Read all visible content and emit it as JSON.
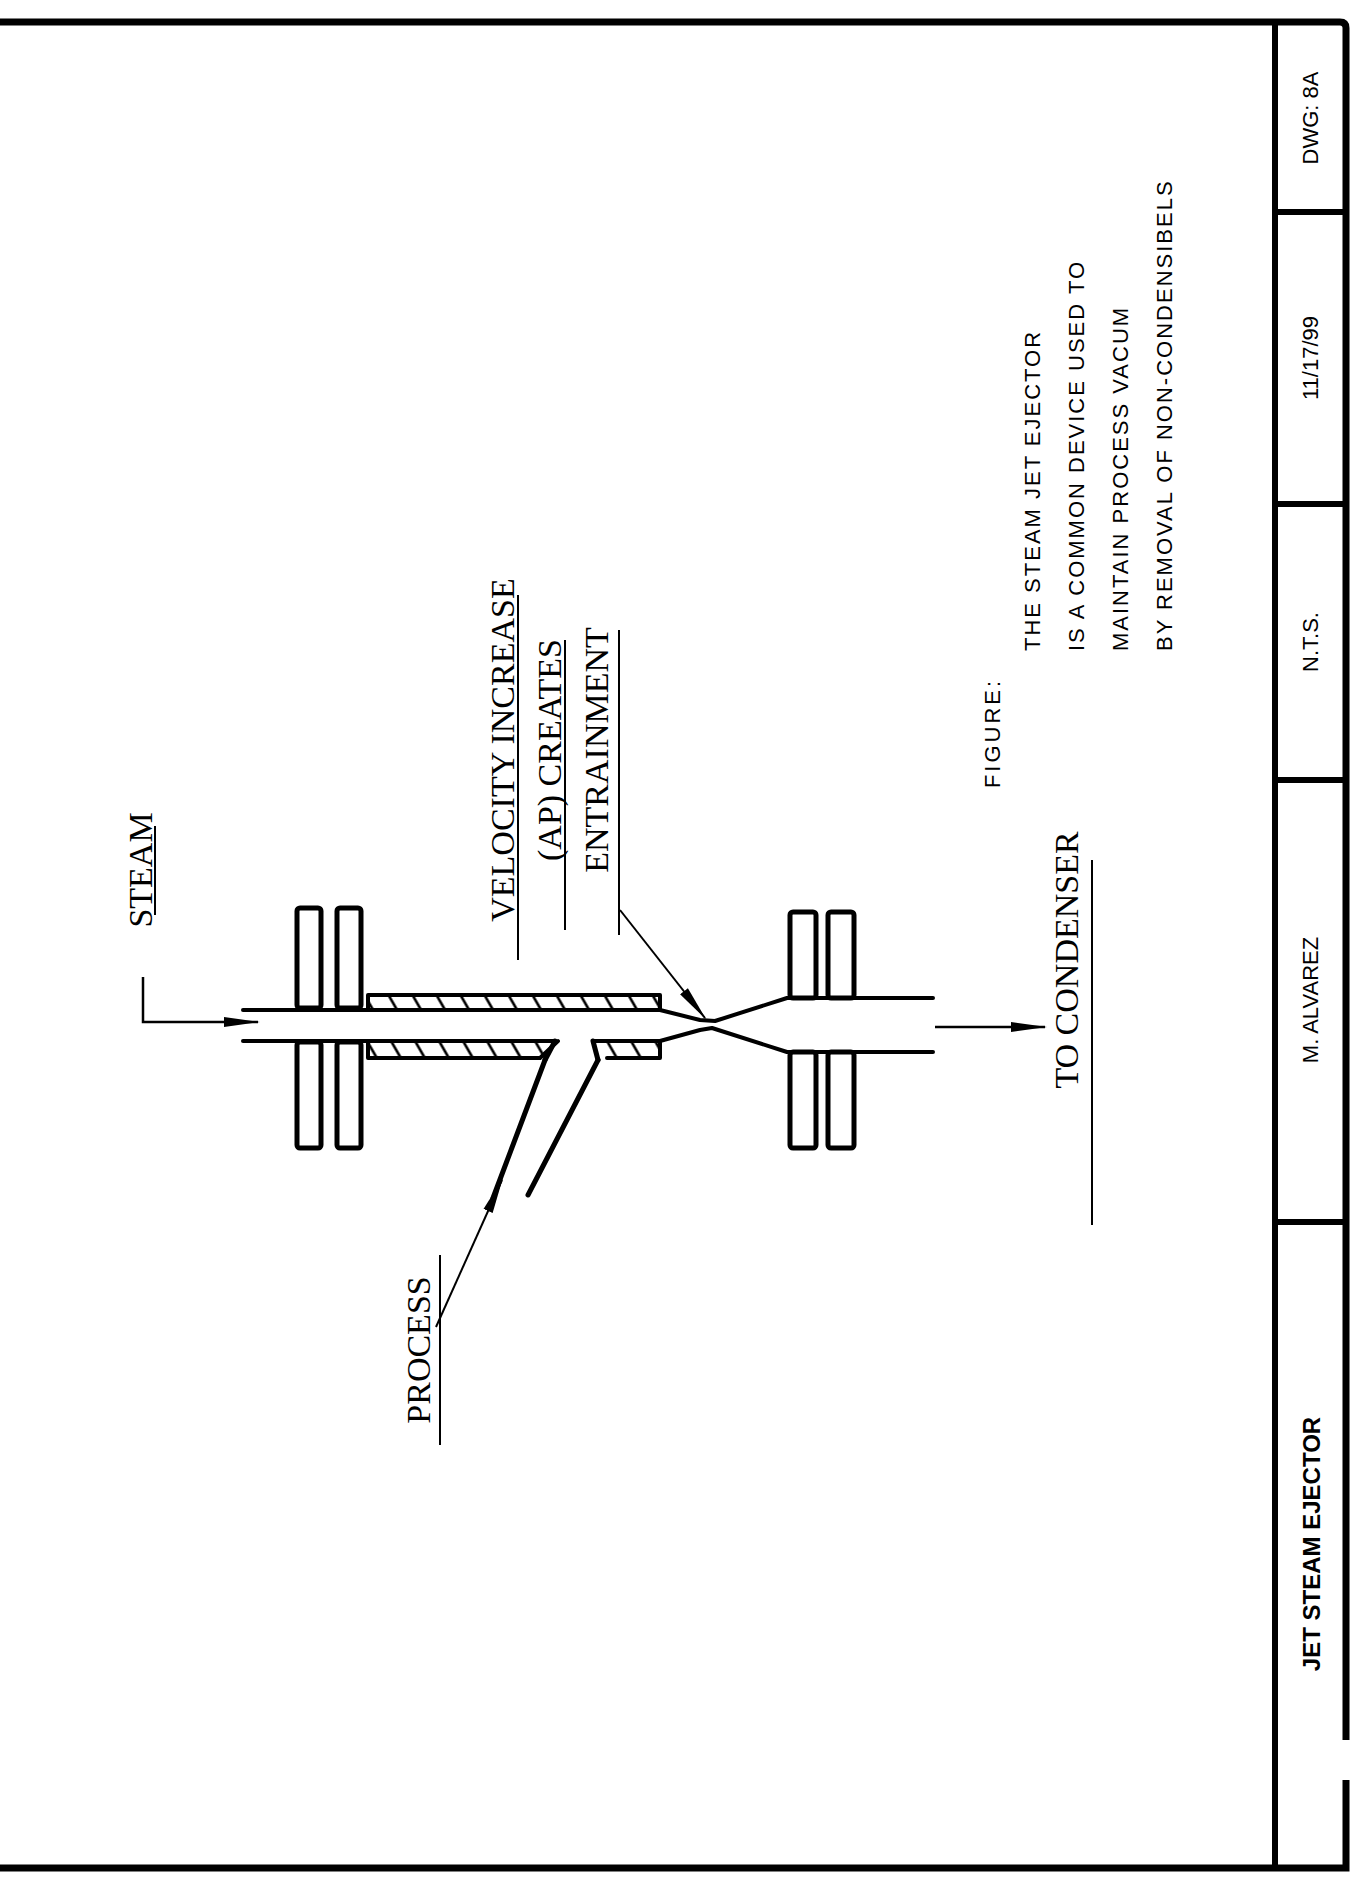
{
  "drawing": {
    "labels": {
      "steam": "STEAM",
      "process": "PROCESS",
      "to_condenser": "TO CONDENSER",
      "velocity_note": [
        "VELOCITY INCREASE",
        "(AP) CREATES",
        "ENTRAINMENT"
      ]
    },
    "figure": {
      "heading": "FIGURE:",
      "lines": [
        "THE STEAM JET EJECTOR",
        "IS A COMMON DEVICE USED TO",
        "MAINTAIN PROCESS VACUM",
        "BY REMOVAL OF NON-CONDENSIBELS"
      ]
    }
  },
  "title_block": {
    "title": "JET STEAM EJECTOR",
    "author": "M. ALVAREZ",
    "scale": "N.T.S.",
    "date": "11/17/99",
    "drawing_number": "DWG: 8A"
  },
  "colors": {
    "ink": "#000000",
    "paper": "#ffffff"
  }
}
